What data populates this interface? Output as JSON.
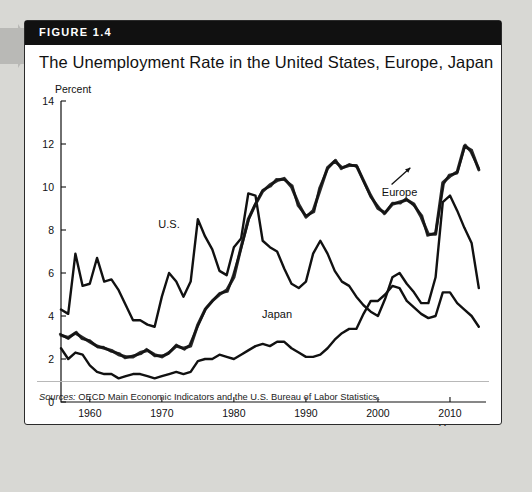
{
  "figure": {
    "badge": "FIGURE 1.4",
    "title": "The Unemployment Rate in the United States, Europe, Japan",
    "source_prefix": "Sources:",
    "source_text": "OECD Main Economic Indicators and the U.S. Bureau of Labor Statistics."
  },
  "chart_data": {
    "type": "line",
    "title": "The Unemployment Rate in the United States, Europe, Japan",
    "xlabel": "Year",
    "ylabel": "Percent",
    "ylim": [
      0,
      14
    ],
    "xlim": [
      1956,
      2015
    ],
    "ytick_labels": [
      "0",
      "2",
      "4",
      "6",
      "8",
      "10",
      "12",
      "14"
    ],
    "yticks": [
      0,
      2,
      4,
      6,
      8,
      10,
      12,
      14
    ],
    "xtick_labels": [
      "1960",
      "1970",
      "1980",
      "1990",
      "2000",
      "2010"
    ],
    "xticks": [
      1960,
      1970,
      1980,
      1990,
      2000,
      2010
    ],
    "grid": false,
    "legend_position": "inline-annotations",
    "annotations": [
      {
        "text": "U.S.",
        "x": 1971,
        "y": 8.1
      },
      {
        "text": "Japan",
        "x": 1986,
        "y": 3.9
      },
      {
        "text": "Europe",
        "x": 2003,
        "y": 9.6,
        "arrow_to": {
          "x": 2004.5,
          "y": 10.9
        }
      }
    ],
    "x": [
      1956,
      1957,
      1958,
      1959,
      1960,
      1961,
      1962,
      1963,
      1964,
      1965,
      1966,
      1967,
      1968,
      1969,
      1970,
      1971,
      1972,
      1973,
      1974,
      1975,
      1976,
      1977,
      1978,
      1979,
      1980,
      1981,
      1982,
      1983,
      1984,
      1985,
      1986,
      1987,
      1988,
      1989,
      1990,
      1991,
      1992,
      1993,
      1994,
      1995,
      1996,
      1997,
      1998,
      1999,
      2000,
      2001,
      2002,
      2003,
      2004,
      2005,
      2006,
      2007,
      2008,
      2009,
      2010,
      2011,
      2012,
      2013,
      2014
    ],
    "series": [
      {
        "name": "U.S.",
        "values": [
          4.3,
          4.1,
          6.9,
          5.4,
          5.5,
          6.7,
          5.6,
          5.7,
          5.2,
          4.5,
          3.8,
          3.8,
          3.6,
          3.5,
          4.9,
          6.0,
          5.6,
          4.9,
          5.6,
          8.5,
          7.7,
          7.1,
          6.1,
          5.9,
          7.2,
          7.6,
          9.7,
          9.6,
          7.5,
          7.2,
          7.0,
          6.2,
          5.5,
          5.3,
          5.6,
          6.9,
          7.5,
          6.9,
          6.1,
          5.6,
          5.4,
          4.9,
          4.5,
          4.2,
          4.0,
          4.8,
          5.8,
          6.0,
          5.5,
          5.1,
          4.6,
          4.6,
          5.8,
          9.3,
          9.6,
          8.9,
          8.1,
          7.4,
          5.3
        ]
      },
      {
        "name": "Japan",
        "values": [
          2.5,
          2.0,
          2.3,
          2.2,
          1.7,
          1.4,
          1.3,
          1.3,
          1.1,
          1.2,
          1.3,
          1.3,
          1.2,
          1.1,
          1.2,
          1.3,
          1.4,
          1.3,
          1.4,
          1.9,
          2.0,
          2.0,
          2.2,
          2.1,
          2.0,
          2.2,
          2.4,
          2.6,
          2.7,
          2.6,
          2.8,
          2.8,
          2.5,
          2.3,
          2.1,
          2.1,
          2.2,
          2.5,
          2.9,
          3.2,
          3.4,
          3.4,
          4.1,
          4.7,
          4.7,
          5.0,
          5.4,
          5.3,
          4.7,
          4.4,
          4.1,
          3.9,
          4.0,
          5.1,
          5.1,
          4.6,
          4.3,
          4.0,
          3.5
        ]
      },
      {
        "name": "Europe",
        "values": [
          3.1,
          3.0,
          3.2,
          3.0,
          2.8,
          2.6,
          2.5,
          2.4,
          2.2,
          2.1,
          2.1,
          2.3,
          2.4,
          2.2,
          2.1,
          2.3,
          2.6,
          2.5,
          2.6,
          3.6,
          4.3,
          4.7,
          5.0,
          5.2,
          5.8,
          7.2,
          8.5,
          9.2,
          9.8,
          10.1,
          10.3,
          10.4,
          10.0,
          9.2,
          8.6,
          8.9,
          9.9,
          10.9,
          11.2,
          10.9,
          11.0,
          11.0,
          10.3,
          9.6,
          9.0,
          8.8,
          9.2,
          9.3,
          9.4,
          9.2,
          8.6,
          7.8,
          7.8,
          10.2,
          10.5,
          10.7,
          11.9,
          11.7,
          10.8
        ]
      }
    ]
  }
}
